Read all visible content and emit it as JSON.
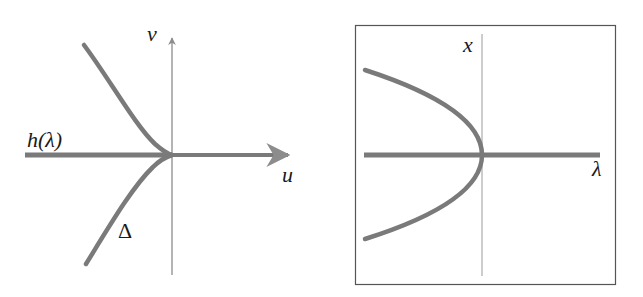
{
  "left_panel": {
    "labels": {
      "vertical_axis": "v",
      "horizontal_axis": "u",
      "horizontal_line": "h(λ)",
      "cusp_curve": "Δ"
    },
    "description": "Cusp curve Δ meeting the line h(λ) at the origin of the (u,v) plane"
  },
  "right_panel": {
    "labels": {
      "vertical_axis": "x",
      "horizontal_axis": "λ"
    },
    "description": "Saddle-node (fold) bifurcation diagram: parabola opening left with vertex on the λ-axis, plus horizontal branch"
  },
  "colors": {
    "curve": "#7a7a7a",
    "axis": "#8c8c8c",
    "frame": "#555555",
    "text": "#1a1a1a"
  }
}
